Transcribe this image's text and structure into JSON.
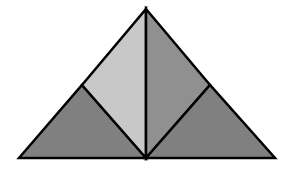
{
  "diagram": {
    "type": "geometric-dissection",
    "vertices": {
      "apex": [
        146,
        9
      ],
      "bottom_left": [
        19,
        158
      ],
      "bottom_right": [
        275,
        158
      ],
      "bottom_mid": [
        146,
        158
      ],
      "left_mid": [
        82,
        85
      ],
      "right_mid": [
        210,
        85
      ]
    },
    "pieces": [
      {
        "name": "bottom-left-triangle",
        "points": "19,158 82,85 146,158",
        "fill": "#808080"
      },
      {
        "name": "upper-left-triangle",
        "points": "82,85 146,9 146,158",
        "fill": "#c8c8c8"
      },
      {
        "name": "upper-right-triangle",
        "points": "146,9 210,85 146,158",
        "fill": "#909090"
      },
      {
        "name": "bottom-right-triangle",
        "points": "146,158 210,85 275,158",
        "fill": "#808080"
      }
    ],
    "stroke_color": "#000000",
    "stroke_width": 2.5
  }
}
